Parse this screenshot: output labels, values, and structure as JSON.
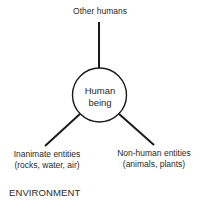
{
  "diagram": {
    "center": {
      "line1": "Human",
      "line2": "being"
    },
    "nodes": {
      "top": {
        "line1": "Other humans"
      },
      "left": {
        "line1": "Inanimate entities",
        "line2": "(rocks, water, air)"
      },
      "right": {
        "line1": "Non-human entities",
        "line2": "(animals, plants)"
      }
    },
    "container_label": "ENVIRONMENT",
    "colors": {
      "line": "#1a1a1a",
      "text": "#2a2a2a",
      "background": "#ffffff"
    }
  }
}
